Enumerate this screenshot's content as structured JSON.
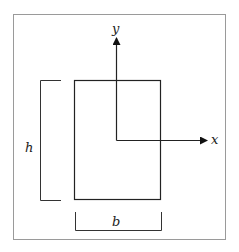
{
  "diagram": {
    "axes": {
      "x_label": "x",
      "y_label": "y"
    },
    "dimensions": {
      "height_label": "h",
      "width_label": "b"
    },
    "colors": {
      "stroke": "#222222",
      "frame": "#9a9a9a",
      "background": "#ffffff"
    }
  }
}
